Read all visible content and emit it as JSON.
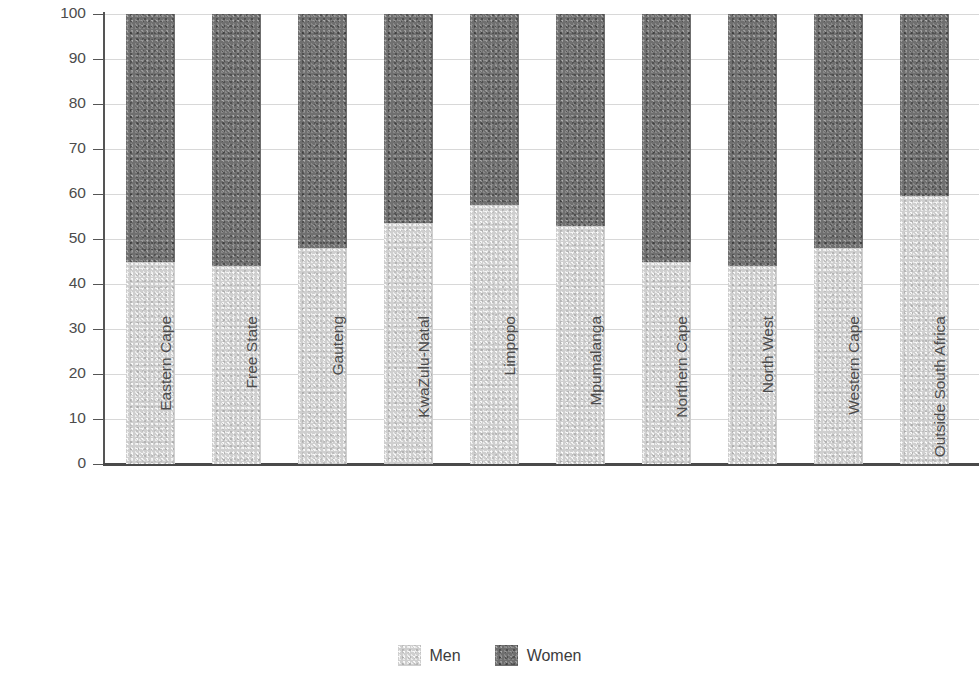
{
  "chart_data": {
    "type": "bar",
    "subtype": "stacked-percentage",
    "title": "",
    "xlabel": "",
    "ylabel": "Percent",
    "ylim": [
      0,
      100
    ],
    "yticks": [
      0,
      10,
      20,
      30,
      40,
      50,
      60,
      70,
      80,
      90,
      100
    ],
    "ytick_labels": [
      "0",
      "10",
      "20",
      "30",
      "40",
      "50",
      "60",
      "70",
      "80",
      "90",
      "100"
    ],
    "grid": true,
    "legend_position": "bottom-center",
    "categories": [
      "Eastern Cape",
      "Free State",
      "Gauteng",
      "KwaZulu-Natal",
      "Limpopo",
      "Mpumalanga",
      "Northern Cape",
      "North West",
      "Western Cape",
      "Outside South Africa"
    ],
    "series": [
      {
        "name": "Men",
        "color": "#cfcfcf",
        "values": [
          45,
          44,
          48,
          53.5,
          57.5,
          53,
          45,
          44,
          48,
          59.5
        ]
      },
      {
        "name": "Women",
        "color": "#6f6f6f",
        "values": [
          55,
          56,
          52,
          46.5,
          42.5,
          47,
          55,
          56,
          52,
          40.5
        ]
      }
    ]
  },
  "legend": {
    "items": [
      {
        "label": "Men",
        "color": "#cfcfcf"
      },
      {
        "label": "Women",
        "color": "#6f6f6f"
      }
    ]
  }
}
